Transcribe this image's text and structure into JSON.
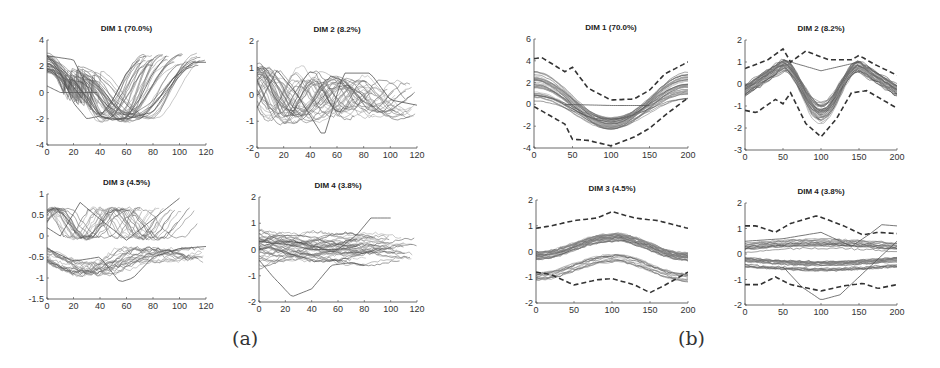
{
  "figure": {
    "captions": [
      {
        "id": "a",
        "label": "(a)",
        "x": 232,
        "y": 327
      },
      {
        "id": "b",
        "label": "(b)",
        "x": 678,
        "y": 327
      }
    ]
  },
  "chart_data": [
    {
      "group": "(a)",
      "type": "line",
      "title": "DIM 1 (70.0%)",
      "xlabel": "",
      "ylabel": "",
      "xlim": [
        0,
        120
      ],
      "ylim": [
        -4,
        4
      ],
      "xticks": [
        0,
        20,
        40,
        60,
        80,
        100,
        120
      ],
      "yticks": [
        -4,
        -2,
        0,
        2,
        4
      ],
      "grid": false,
      "legend": null,
      "box": {
        "x0": 47,
        "x1": 206,
        "y0": 40,
        "y1": 145
      },
      "description": "Bundle of ~50 time-warped trajectories of varying length (70-120 samples); start near 2 to 3, dip to about -2 around x=30-60, rise back to 2-3 by x=70-120",
      "bundle": {
        "shape": "dip",
        "count": 40,
        "start": [
          1.5,
          3.0
        ],
        "min": [
          -2.3,
          -1.5
        ],
        "end": [
          2.0,
          3.0
        ],
        "len": [
          70,
          120
        ],
        "jitter": 0.3
      },
      "series": [
        {
          "name": "representative-early",
          "x": [
            0,
            10,
            20,
            30,
            40,
            50,
            60,
            70
          ],
          "y": [
            2.8,
            1.5,
            -0.8,
            -2.0,
            -1.8,
            -0.5,
            1.5,
            2.5
          ]
        },
        {
          "name": "representative-mid",
          "x": [
            0,
            20,
            30,
            40,
            50,
            60,
            70,
            80,
            90
          ],
          "y": [
            2.8,
            2.5,
            0.5,
            -1.8,
            -2.1,
            -1.9,
            -0.5,
            1.5,
            2.8
          ]
        },
        {
          "name": "representative-late",
          "x": [
            0,
            20,
            40,
            50,
            60,
            80,
            100,
            110,
            120
          ],
          "y": [
            2.8,
            1.0,
            -1.8,
            -2.0,
            -2.0,
            -1.5,
            1.5,
            2.3,
            2.3
          ]
        },
        {
          "name": "flat-segment",
          "x": [
            0,
            10,
            38
          ],
          "y": [
            0.5,
            0.0,
            0.0
          ]
        }
      ]
    },
    {
      "group": "(a)",
      "type": "line",
      "title": "DIM 2 (8.2%)",
      "xlabel": "",
      "ylabel": "",
      "xlim": [
        0,
        120
      ],
      "ylim": [
        -2,
        2
      ],
      "xticks": [
        0,
        20,
        40,
        60,
        80,
        100,
        120
      ],
      "yticks": [
        -2,
        -1,
        0,
        1,
        2
      ],
      "grid": false,
      "legend": null,
      "box": {
        "x0": 257,
        "x1": 417,
        "y0": 41,
        "y1": 148
      },
      "description": "Bundle of oscillating trajectories; peaks near +1 around x=10-30 and x=50-80, troughs near -1.5 around x=40-60, tails decaying to about -0.5 by x=100-120",
      "bundle": {
        "shape": "wave2",
        "count": 40,
        "amp": [
          0.6,
          1.1
        ],
        "len": [
          70,
          120
        ],
        "jitter": 0.3
      },
      "series": [
        {
          "name": "representative",
          "x": [
            0,
            15,
            30,
            50,
            65,
            85,
            100,
            120
          ],
          "y": [
            -0.5,
            0.9,
            0.0,
            -1.6,
            0.8,
            0.8,
            -0.2,
            -0.4
          ]
        }
      ]
    },
    {
      "group": "(a)",
      "type": "line",
      "title": "DIM 3 (4.5%)",
      "xlabel": "",
      "ylabel": "",
      "xlim": [
        0,
        120
      ],
      "ylim": [
        -1.5,
        1
      ],
      "xticks": [
        0,
        20,
        40,
        60,
        80,
        100,
        120
      ],
      "yticks": [
        -1.5,
        -1,
        -0.5,
        0,
        0.5,
        1
      ],
      "grid": false,
      "legend": null,
      "box": {
        "x0": 47,
        "x1": 206,
        "y0": 194,
        "y1": 299
      },
      "description": "Bundle of trajectories mostly between -1 and 0.8; upper group peaks near 0.8 at x=25, lower group dips to about -1.1 around x=55-70",
      "bundle": {
        "shape": "dim3a",
        "count": 40,
        "len": [
          70,
          120
        ],
        "jitter": 0.25
      },
      "series": [
        {
          "name": "upper",
          "x": [
            0,
            10,
            25,
            40,
            60,
            80,
            100
          ],
          "y": [
            0.2,
            0.0,
            0.8,
            0.4,
            -0.1,
            0.4,
            0.9
          ]
        },
        {
          "name": "lower",
          "x": [
            0,
            20,
            40,
            55,
            65,
            80,
            100,
            120
          ],
          "y": [
            -0.3,
            -0.6,
            -0.5,
            -1.1,
            -1.0,
            -0.5,
            -0.3,
            -0.25
          ]
        }
      ]
    },
    {
      "group": "(a)",
      "type": "line",
      "title": "DIM 4 (3.8%)",
      "xlabel": "",
      "ylabel": "",
      "xlim": [
        0,
        120
      ],
      "ylim": [
        -2,
        2
      ],
      "xticks": [
        0,
        20,
        40,
        60,
        80,
        100,
        120
      ],
      "yticks": [
        -2,
        -1,
        0,
        1,
        2
      ],
      "grid": false,
      "legend": null,
      "box": {
        "x0": 259,
        "x1": 417,
        "y0": 197,
        "y1": 302
      },
      "description": "Dense bundle between -0.7 and 0.7, with one outlier dipping to -1.8 at x=25 and one rising to 1.2 at x=85-100",
      "bundle": {
        "shape": "dim4",
        "count": 40,
        "len": [
          70,
          120
        ],
        "jitter": 0.25
      },
      "series": [
        {
          "name": "outlier-low",
          "x": [
            0,
            10,
            25,
            40,
            55,
            70,
            80
          ],
          "y": [
            -0.4,
            -1.0,
            -1.8,
            -1.5,
            -0.6,
            -0.5,
            -0.6
          ]
        },
        {
          "name": "outlier-high",
          "x": [
            0,
            20,
            40,
            60,
            75,
            85,
            100
          ],
          "y": [
            0.3,
            0.2,
            0.0,
            0.0,
            0.6,
            1.2,
            1.2
          ]
        }
      ]
    },
    {
      "group": "(b)",
      "type": "line",
      "title": "DIM 1 (70.0%)",
      "xlabel": "",
      "ylabel": "",
      "xlim": [
        0,
        200
      ],
      "ylim": [
        -4,
        6
      ],
      "xticks": [
        0,
        50,
        100,
        150,
        200
      ],
      "yticks": [
        -4,
        -2,
        0,
        2,
        4,
        6
      ],
      "grid": false,
      "legend": null,
      "box": {
        "x0": 534,
        "x1": 688,
        "y0": 39,
        "y1": 148
      },
      "description": "Time-normalized bundle: starts 0.5-3, dips to about -2 at x=100, returns to 1-3 at x=200; dashed envelope bounds",
      "bundle": {
        "shape": "dipnorm",
        "count": 40,
        "start": [
          0.3,
          3.0
        ],
        "min": [
          -2.3,
          -1.2
        ],
        "end": [
          0.5,
          3.0
        ],
        "jitter": 0.2
      },
      "envelope_upper": {
        "x": [
          0,
          10,
          40,
          50,
          70,
          100,
          130,
          150,
          170,
          200
        ],
        "y": [
          4.2,
          4.3,
          3.0,
          3.4,
          1.5,
          0.4,
          0.5,
          1.3,
          2.8,
          3.9
        ]
      },
      "envelope_lower": {
        "x": [
          0,
          20,
          40,
          50,
          70,
          100,
          130,
          150,
          170,
          200
        ],
        "y": [
          -0.2,
          -1.0,
          -1.8,
          -3.2,
          -3.3,
          -3.8,
          -3.0,
          -2.2,
          -1.0,
          0.6
        ]
      },
      "series": [
        {
          "name": "flat-segment",
          "x": [
            40,
            100,
            150
          ],
          "y": [
            0.0,
            -0.1,
            -0.1
          ]
        }
      ]
    },
    {
      "group": "(b)",
      "type": "line",
      "title": "DIM 2 (8.2%)",
      "xlabel": "",
      "ylabel": "",
      "xlim": [
        0,
        200
      ],
      "ylim": [
        -3,
        2
      ],
      "xticks": [
        0,
        50,
        100,
        150,
        200
      ],
      "yticks": [
        -3,
        -2,
        -1,
        0,
        1,
        2
      ],
      "grid": false,
      "legend": null,
      "box": {
        "x0": 745,
        "x1": 897,
        "y0": 40,
        "y1": 150
      },
      "description": "Peaks near 0.9 at x=50 and x=150, trough about -1.2 at x=100; dashed envelope",
      "bundle": {
        "shape": "mw",
        "count": 40,
        "jitter": 0.3
      },
      "envelope_upper": {
        "x": [
          0,
          30,
          50,
          60,
          80,
          110,
          140,
          150,
          170,
          200
        ],
        "y": [
          0.7,
          1.1,
          1.6,
          1.0,
          1.5,
          1.1,
          1.1,
          1.3,
          0.9,
          0.4
        ]
      },
      "envelope_lower": {
        "x": [
          0,
          15,
          40,
          50,
          60,
          80,
          100,
          120,
          140,
          160,
          200
        ],
        "y": [
          -1.2,
          -1.3,
          -0.7,
          -0.9,
          -0.4,
          -1.8,
          -2.4,
          -1.6,
          -0.4,
          -0.3,
          -1.1
        ]
      },
      "series": [
        {
          "name": "upper-outlier",
          "x": [
            50,
            100,
            150
          ],
          "y": [
            1.1,
            0.6,
            1.0
          ]
        }
      ]
    },
    {
      "group": "(b)",
      "type": "line",
      "title": "DIM 3 (4.5%)",
      "xlabel": "",
      "ylabel": "",
      "xlim": [
        0,
        200
      ],
      "ylim": [
        -2,
        2
      ],
      "xticks": [
        0,
        50,
        100,
        150,
        200
      ],
      "yticks": [
        -2,
        -1,
        0,
        1,
        2
      ],
      "grid": false,
      "legend": null,
      "box": {
        "x0": 536,
        "x1": 688,
        "y0": 200,
        "y1": 303
      },
      "description": "Two sub-bundles (around 0 to 0.5 and -0.5 to -1) with a hump at x=100 and dip at x=150; dashed envelope",
      "bundle": {
        "shape": "twoband",
        "count": 40,
        "jitter": 0.2
      },
      "envelope_upper": {
        "x": [
          0,
          20,
          50,
          80,
          100,
          130,
          160,
          200
        ],
        "y": [
          0.9,
          1.0,
          1.2,
          1.3,
          1.55,
          1.3,
          1.2,
          0.9
        ]
      },
      "envelope_lower": {
        "x": [
          0,
          20,
          50,
          80,
          100,
          130,
          150,
          170,
          200
        ],
        "y": [
          -0.8,
          -0.9,
          -1.3,
          -1.1,
          -1.05,
          -1.3,
          -1.6,
          -1.3,
          -0.8
        ]
      },
      "series": []
    },
    {
      "group": "(b)",
      "type": "line",
      "title": "DIM 4 (3.8%)",
      "xlabel": "",
      "ylabel": "",
      "xlim": [
        0,
        200
      ],
      "ylim": [
        -2,
        2
      ],
      "xticks": [
        0,
        50,
        100,
        150,
        200
      ],
      "yticks": [
        -2,
        -1,
        0,
        1,
        2
      ],
      "grid": false,
      "legend": null,
      "box": {
        "x0": 745,
        "x1": 897,
        "y0": 203,
        "y1": 305
      },
      "description": "Dense band between -0.6 and 0.5, split around x=60-140; outliers to -1.8 near x=100 and 1.1 near x=170; dashed envelope",
      "bundle": {
        "shape": "dim4b",
        "count": 40,
        "jitter": 0.2
      },
      "envelope_upper": {
        "x": [
          0,
          15,
          40,
          60,
          95,
          130,
          155,
          175,
          200
        ],
        "y": [
          1.1,
          1.1,
          0.85,
          1.2,
          1.5,
          1.1,
          0.75,
          0.85,
          0.8
        ]
      },
      "envelope_lower": {
        "x": [
          0,
          20,
          40,
          60,
          100,
          130,
          155,
          175,
          200
        ],
        "y": [
          -1.2,
          -1.2,
          -0.9,
          -1.2,
          -1.45,
          -1.25,
          -1.15,
          -1.35,
          -1.2
        ]
      },
      "series": [
        {
          "name": "outlier-low",
          "x": [
            50,
            75,
            100,
            125,
            150,
            175,
            200
          ],
          "y": [
            -0.5,
            -1.3,
            -1.8,
            -1.6,
            -0.9,
            -0.2,
            0.5
          ]
        },
        {
          "name": "outlier-high",
          "x": [
            0,
            50,
            100,
            140,
            165,
            180,
            200
          ],
          "y": [
            0.5,
            0.6,
            0.85,
            0.3,
            0.8,
            1.15,
            1.1
          ]
        }
      ]
    }
  ]
}
